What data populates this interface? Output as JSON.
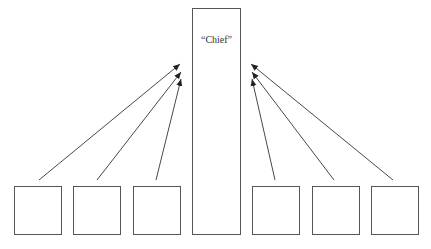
{
  "diagram": {
    "chief": {
      "label": "“Chief”",
      "x": 192,
      "y": 8,
      "w": 49,
      "h": 227
    },
    "left_boxes": [
      {
        "x": 14,
        "y": 186,
        "w": 48,
        "h": 49
      },
      {
        "x": 73,
        "y": 186,
        "w": 48,
        "h": 49
      },
      {
        "x": 133,
        "y": 186,
        "w": 48,
        "h": 49
      }
    ],
    "right_boxes": [
      {
        "x": 252,
        "y": 186,
        "w": 48,
        "h": 49
      },
      {
        "x": 312,
        "y": 186,
        "w": 48,
        "h": 49
      },
      {
        "x": 371,
        "y": 186,
        "w": 48,
        "h": 49
      }
    ],
    "arrows": [
      {
        "from": [
          39,
          180
        ],
        "to": [
          180,
          64
        ]
      },
      {
        "from": [
          97,
          180
        ],
        "to": [
          181,
          72
        ]
      },
      {
        "from": [
          156,
          180
        ],
        "to": [
          181,
          79
        ]
      },
      {
        "from": [
          275,
          180
        ],
        "to": [
          252,
          79
        ]
      },
      {
        "from": [
          334,
          180
        ],
        "to": [
          252,
          72
        ]
      },
      {
        "from": [
          393,
          180
        ],
        "to": [
          251,
          64
        ]
      }
    ],
    "stroke_color": "#333333"
  }
}
